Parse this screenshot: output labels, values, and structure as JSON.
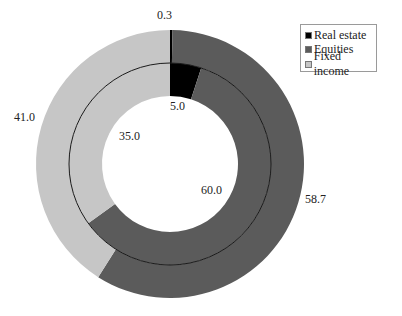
{
  "chart_data": {
    "type": "pie",
    "subtype": "nested-donut",
    "title": "",
    "categories": [
      "Real estate",
      "Equities",
      "Fixed income"
    ],
    "colors": [
      "#000000",
      "#5b5b5b",
      "#c6c6c6"
    ],
    "series": [
      {
        "name": "inner",
        "ring": "inner",
        "values": [
          5.0,
          60.0,
          35.0
        ]
      },
      {
        "name": "outer",
        "ring": "outer",
        "values": [
          0.3,
          58.7,
          41.0
        ]
      }
    ],
    "start_angle": "12 o'clock",
    "direction": "clockwise",
    "legend_position": "upper right"
  },
  "labels": {
    "outer_real_estate": "0.3",
    "outer_equities": "58.7",
    "outer_fixed_income": "41.0",
    "inner_real_estate": "5.0",
    "inner_equities": "60.0",
    "inner_fixed_income": "35.0"
  },
  "legend": {
    "items": [
      {
        "label": "Real estate",
        "color": "#000000"
      },
      {
        "label": "Equities",
        "color": "#5b5b5b"
      },
      {
        "label": "Fixed income",
        "color": "#c6c6c6"
      }
    ]
  }
}
